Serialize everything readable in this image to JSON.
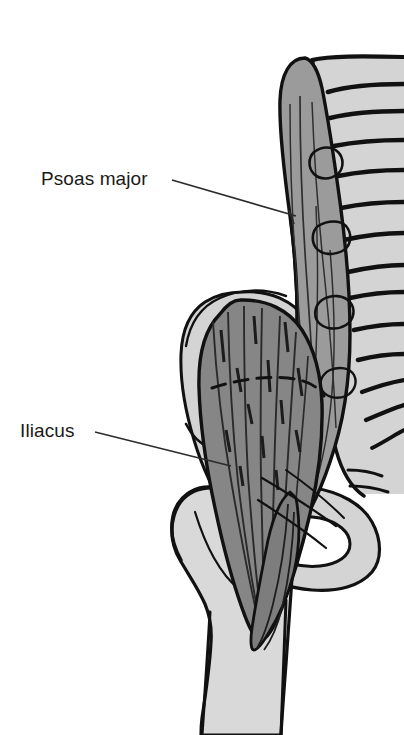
{
  "figure": {
    "kind": "anatomical-illustration",
    "background_color": "#ffffff",
    "width": 404,
    "height": 735
  },
  "labels": [
    {
      "id": "psoas-major",
      "text": "Psoas major",
      "x": 41,
      "y": 169,
      "leader": {
        "from_x": 172,
        "from_y": 180,
        "to_x": 296,
        "to_y": 216
      }
    },
    {
      "id": "iliacus",
      "text": "Iliacus",
      "x": 20,
      "y": 421,
      "leader": {
        "from_x": 95,
        "from_y": 432,
        "to_x": 231,
        "to_y": 466
      }
    }
  ],
  "structures": [
    {
      "id": "lumbar-vertebral-column",
      "name": "Lumbar vertebrae and sacrum",
      "fill": "#d4d4d4",
      "stroke": "#111111"
    },
    {
      "id": "psoas-major-muscle",
      "name": "Psoas major",
      "fill": "#9b9b9b",
      "stroke": "#111111"
    },
    {
      "id": "iliac-crest-bone",
      "name": "Ilium / iliac crest",
      "fill": "#d4d4d4",
      "stroke": "#111111"
    },
    {
      "id": "iliacus-muscle",
      "name": "Iliacus",
      "fill": "#868686",
      "stroke": "#111111"
    },
    {
      "id": "pubis-ischium",
      "name": "Pubis and ischium with obturator foramen",
      "fill": "#d4d4d4",
      "stroke": "#111111"
    },
    {
      "id": "femur-bone",
      "name": "Femur with head, neck and greater trochanter",
      "fill": "#d9d9d9",
      "stroke": "#111111"
    },
    {
      "id": "iliopsoas-tendon",
      "name": "Common iliopsoas tendon inserting on lesser trochanter",
      "fill": "#7d7d7d",
      "stroke": "#111111"
    }
  ],
  "colors": {
    "ink": "#111111",
    "bone_light": "#d4d4d4",
    "bone_pale": "#d9d9d9",
    "muscle_psoas": "#9b9b9b",
    "muscle_iliacus": "#868686",
    "tendon": "#7d7d7d",
    "label_text": "#1a1a1a",
    "leader_line": "#2b2b2b"
  }
}
